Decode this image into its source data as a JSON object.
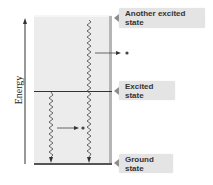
{
  "diagram": {
    "axis": {
      "label": "Energy",
      "direction": "up"
    },
    "levels": [
      {
        "id": "another-excited",
        "label": "Another excited state"
      },
      {
        "id": "excited",
        "label": "Excited state"
      },
      {
        "id": "ground",
        "label": "Ground state"
      }
    ],
    "transitions": [
      {
        "from": "another-excited",
        "to": "ground",
        "type": "wavy-emission",
        "photon_arrow": "right"
      },
      {
        "from": "excited",
        "to": "ground",
        "type": "wavy-emission",
        "photon_arrow": "right"
      }
    ],
    "colors": {
      "panel": "#ececec",
      "panel_edge": "#b5b5b5",
      "tag_bg": "#e4e4e4",
      "line": "#333333"
    }
  }
}
